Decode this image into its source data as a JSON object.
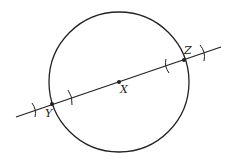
{
  "diagram": {
    "type": "geometric-construction",
    "colors": {
      "stroke": "#222222",
      "background": "#ffffff"
    },
    "circle": {
      "center_label": "X",
      "cx": 119,
      "cy": 82,
      "r": 70
    },
    "line": {
      "x1": 16,
      "y1": 117,
      "x2": 221,
      "y2": 47
    },
    "points": [
      {
        "label": "X",
        "x": 119,
        "y": 82,
        "label_x": 120,
        "label_y": 93
      },
      {
        "label": "Y",
        "x": 52,
        "y": 104,
        "label_x": 45,
        "label_y": 117
      },
      {
        "label": "Z",
        "x": 184,
        "y": 60,
        "label_x": 184,
        "label_y": 54
      }
    ],
    "arc_marks": [
      {
        "near": "Y",
        "position": "outer",
        "x": 35,
        "y": 110
      },
      {
        "near": "Y",
        "position": "inner",
        "x": 70,
        "y": 98
      },
      {
        "near": "Z",
        "position": "inner",
        "x": 167,
        "y": 66
      },
      {
        "near": "Z",
        "position": "outer",
        "x": 203,
        "y": 53
      }
    ]
  }
}
